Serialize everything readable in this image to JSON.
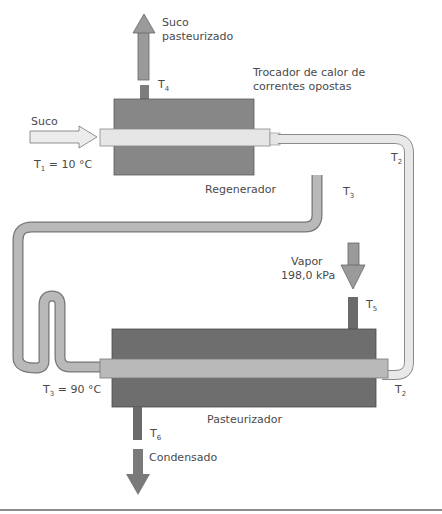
{
  "diagram": {
    "title_lines": [
      "Trocador de calor de",
      "correntes opostas"
    ],
    "colors": {
      "shell_top": "#878787",
      "shell_bottom": "#6e6e6e",
      "juice_cold": "#e6e6e6",
      "juice_hot": "#b9b9b9",
      "arrow_dark": "#7a7a7a",
      "stroke": "#555555",
      "text": "#4a4a4a"
    },
    "units": {
      "regenerator": {
        "label": "Regenerador"
      },
      "pasteurizer": {
        "label": "Pasteurizador"
      }
    },
    "streams": {
      "inlet": {
        "label": "Suco",
        "temp_symbol": "T",
        "temp_sub": "1",
        "temp_value": " = 10 °C"
      },
      "outlet": {
        "label_lines": [
          "Suco",
          "pasteurizado"
        ],
        "temp_symbol": "T",
        "temp_sub": "4"
      },
      "steam": {
        "label_lines": [
          "Vapor",
          "198,0 kPa"
        ],
        "temp_symbol": "T",
        "temp_sub": "5"
      },
      "condensate": {
        "label": "Condensado",
        "temp_symbol": "T",
        "temp_sub": "6"
      },
      "hot_juice": {
        "temp_symbol": "T",
        "temp_sub": "3",
        "temp_value": " = 90 °C"
      },
      "regenerator_out_T3": {
        "temp_symbol": "T",
        "temp_sub": "3"
      },
      "regenerator_T2": {
        "temp_symbol": "T",
        "temp_sub": "2"
      },
      "pasteurizer_T2": {
        "temp_symbol": "T",
        "temp_sub": "2"
      }
    }
  }
}
